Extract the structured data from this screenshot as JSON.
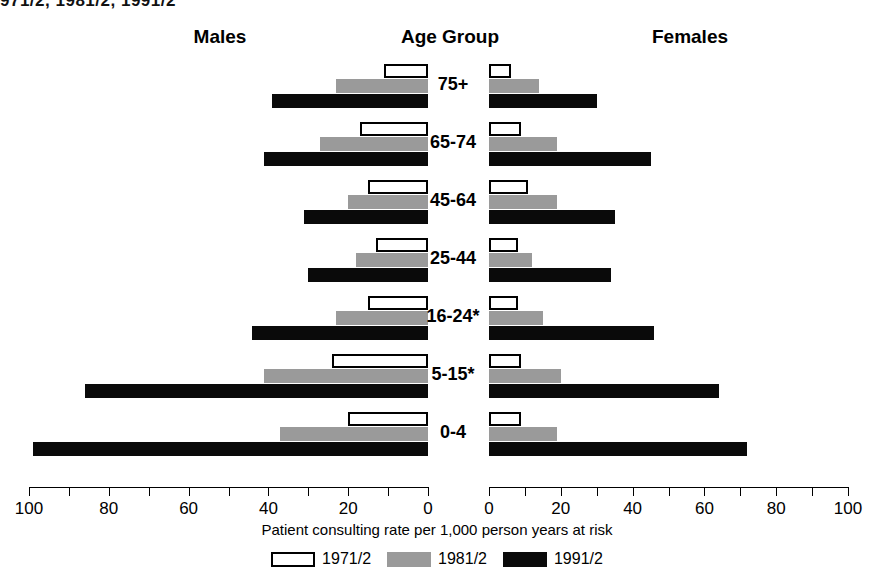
{
  "title_clipped": "971/2, 1981/2, 1991/2",
  "headers": {
    "males": "Males",
    "age": "Age Group",
    "females": "Females"
  },
  "xtitle": "Patient consulting rate per 1,000 person years at risk",
  "legend": [
    {
      "label": "1971/2",
      "color": "#ffffff",
      "key": "y1971"
    },
    {
      "label": "1981/2",
      "color": "#9a9a9a",
      "key": "y1981"
    },
    {
      "label": "1991/2",
      "color": "#0a0a0a",
      "key": "y1991"
    }
  ],
  "ticks": [
    0,
    10,
    20,
    30,
    40,
    50,
    60,
    70,
    80,
    90,
    100
  ],
  "tick_labels_left": [
    "100",
    "80",
    "60",
    "40",
    "20",
    "0"
  ],
  "tick_labels_right": [
    "0",
    "20",
    "40",
    "60",
    "80",
    "100"
  ],
  "chart_data": {
    "type": "bar",
    "xlabel": "Patient consulting rate per 1,000 person years at risk",
    "ylabel": "Age Group",
    "orientation": "horizontal",
    "layout": "population-pyramid",
    "grid": false,
    "legend_position": "bottom",
    "xlim_left": [
      100,
      0
    ],
    "xlim_right": [
      0,
      100
    ],
    "categories": [
      "75+",
      "65-74",
      "45-64",
      "25-44",
      "16-24*",
      "5-15*",
      "0-4"
    ],
    "panels": [
      {
        "name": "Males",
        "series": [
          {
            "name": "1971/2",
            "values": [
              11,
              17,
              15,
              13,
              15,
              24,
              20
            ]
          },
          {
            "name": "1981/2",
            "values": [
              23,
              27,
              20,
              18,
              23,
              41,
              37
            ]
          },
          {
            "name": "1991/2",
            "values": [
              39,
              41,
              31,
              30,
              44,
              86,
              99
            ]
          }
        ]
      },
      {
        "name": "Females",
        "series": [
          {
            "name": "1971/2",
            "values": [
              6,
              9,
              11,
              8,
              8,
              9,
              9
            ]
          },
          {
            "name": "1981/2",
            "values": [
              14,
              19,
              19,
              12,
              15,
              20,
              19
            ]
          },
          {
            "name": "1991/2",
            "values": [
              30,
              45,
              35,
              34,
              46,
              64,
              72
            ]
          }
        ]
      }
    ]
  }
}
